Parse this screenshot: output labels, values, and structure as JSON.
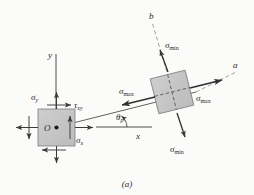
{
  "figure": {
    "caption": "(a)",
    "axes": {
      "y_label": "y",
      "x_label": "x",
      "a_label": "a",
      "b_label": "b"
    },
    "angle": {
      "symbol": "θ",
      "subscript": "p",
      "value_deg": 14
    },
    "original_element": {
      "center_label": "O",
      "sigma_y": "σ",
      "sigma_y_sub": "y",
      "sigma_x": "σ",
      "sigma_x_sub": "x",
      "tau_xy": "τ",
      "tau_xy_sub": "xy",
      "fill_color": "#c6c6c6",
      "stroke_color": "#4a4a4a"
    },
    "rotated_element": {
      "sigma_max_left": "σ",
      "sigma_max_left_sub": "max",
      "sigma_max_right": "σ",
      "sigma_max_right_sub": "max",
      "sigma_min_top": "σ",
      "sigma_min_top_sub": "min",
      "sigma_min_bottom": "σ",
      "sigma_min_bottom_sub": "min",
      "fill_color": "#c6c6c6",
      "stroke_color": "#4a4a4a",
      "rotation_deg": 14
    },
    "colors": {
      "background": "#fbfbfa",
      "ink": "#2a2a2a",
      "dashed": "#6e6e6e"
    }
  }
}
